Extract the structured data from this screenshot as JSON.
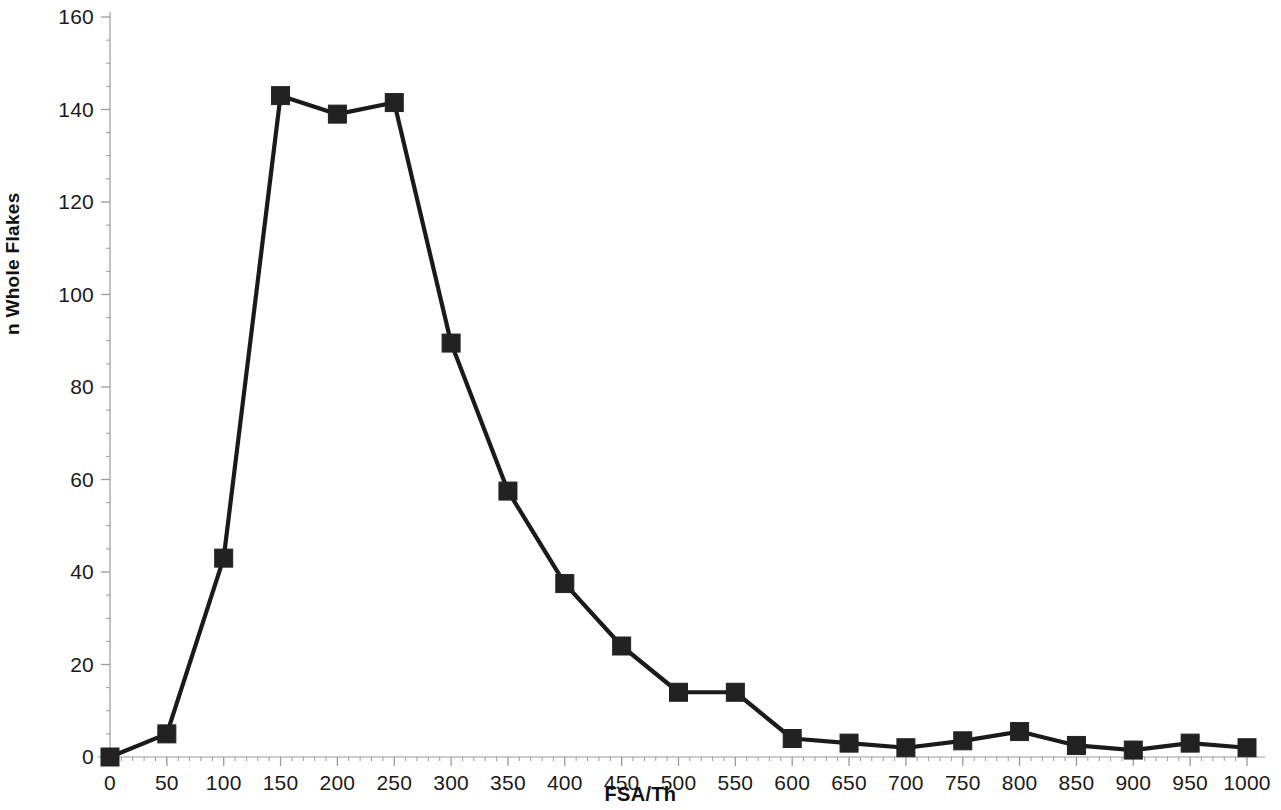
{
  "chart_data": {
    "type": "line",
    "title": "",
    "subtitle": "",
    "xlabel": "FSA/Th",
    "ylabel": "n Whole Flakes",
    "xlim": [
      0,
      1000
    ],
    "ylim": [
      0,
      160
    ],
    "x_tick_labels": [
      "0",
      "50",
      "100",
      "150",
      "200",
      "250",
      "300",
      "350",
      "400",
      "450",
      "500",
      "550",
      "600",
      "650",
      "700",
      "750",
      "800",
      "850",
      "900",
      "950",
      "1000"
    ],
    "y_tick_labels": [
      "0",
      "20",
      "40",
      "60",
      "80",
      "100",
      "120",
      "140",
      "160"
    ],
    "x_ticks": [
      0,
      50,
      100,
      150,
      200,
      250,
      300,
      350,
      400,
      450,
      500,
      550,
      600,
      650,
      700,
      750,
      800,
      850,
      900,
      950,
      1000
    ],
    "y_ticks": [
      0,
      20,
      40,
      60,
      80,
      100,
      120,
      140,
      160
    ],
    "x_minor_tick_step": 10,
    "y_minor_tick_step": 5,
    "grid": false,
    "legend": false,
    "legend_position": "none",
    "series": [
      {
        "name": "n Whole Flakes",
        "marker": "square",
        "marker_color": "#222222",
        "line_color": "#1a1a1a",
        "x": [
          0,
          50,
          100,
          150,
          200,
          250,
          300,
          350,
          400,
          450,
          500,
          550,
          600,
          650,
          700,
          750,
          800,
          850,
          900,
          950,
          1000
        ],
        "values": [
          0,
          5,
          43,
          143,
          139,
          141.5,
          89.5,
          57.5,
          37.5,
          24,
          14,
          14,
          4,
          3,
          2,
          3.5,
          5.5,
          2.5,
          1.5,
          3,
          2
        ]
      }
    ]
  },
  "axes": {
    "y_title": "n Whole Flakes",
    "x_title": "FSA/Th"
  },
  "colors": {
    "line": "#1a1a1a",
    "marker": "#232323",
    "axis": "#9a9a9a",
    "background": "#ffffff",
    "text": "#1a1a1a"
  }
}
